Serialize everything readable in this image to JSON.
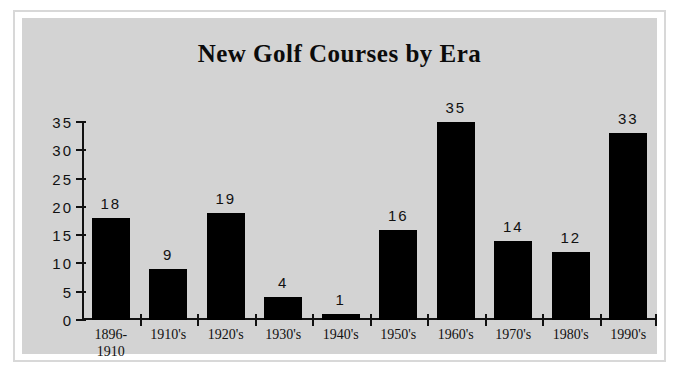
{
  "chart_data": {
    "type": "bar",
    "title": "New Golf Courses by Era",
    "xlabel": "",
    "ylabel": "",
    "categories": [
      "1896-\n1910",
      "1910's",
      "1920's",
      "1930's",
      "1940's",
      "1950's",
      "1960's",
      "1970's",
      "1980's",
      "1990's"
    ],
    "values": [
      18,
      9,
      19,
      4,
      1,
      16,
      35,
      14,
      12,
      33
    ],
    "data_labels": [
      "18",
      "9",
      "19",
      "4",
      "1",
      "16",
      "35",
      "14",
      "12",
      "33"
    ],
    "ylim": [
      0,
      35
    ],
    "ytick_labels": [
      "0",
      "5",
      "10",
      "15",
      "20",
      "25",
      "30",
      "35"
    ],
    "ytick_values": [
      0,
      5,
      10,
      15,
      20,
      25,
      30,
      35
    ],
    "grid": false,
    "legend": null,
    "colors": {
      "bar": "#000000",
      "plot_background": "#d3d3d3",
      "frame": "#d8d8d8",
      "page_background": "#ffffff",
      "text": "#111111"
    }
  }
}
